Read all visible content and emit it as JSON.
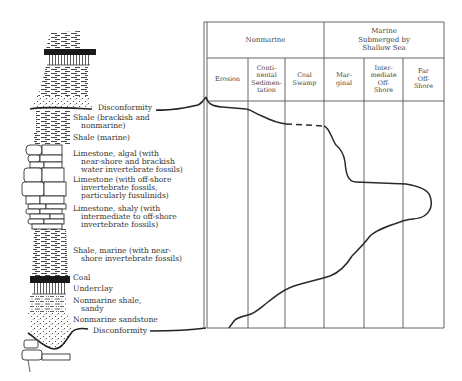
{
  "diagram": {
    "type": "stratigraphic-column-with-environment-curve",
    "column": {
      "labels": [
        {
          "id": "disconformity-top",
          "lines": [
            "Disconformity"
          ]
        },
        {
          "id": "shale-brackish",
          "lines": [
            "Shale (brackish and",
            "nonmarine)"
          ]
        },
        {
          "id": "shale-marine",
          "lines": [
            "Shale (marine)"
          ]
        },
        {
          "id": "limestone-algal",
          "lines": [
            "Limestone, algal (with",
            "near-shore and brackish",
            "water invertebrate fossils)"
          ]
        },
        {
          "id": "limestone-offshore",
          "lines": [
            "Limestone (with off-shore",
            "invertebrate fossils,",
            "particularly fusulinids)"
          ]
        },
        {
          "id": "limestone-shaly",
          "lines": [
            "Limestone, shaly (with",
            "intermediate to off-shore",
            "invertebrate fossils)"
          ]
        },
        {
          "id": "shale-marine-nearshore",
          "lines": [
            "Shale, marine (with near-",
            "shore invertebrate fossils)"
          ]
        },
        {
          "id": "coal",
          "lines": [
            "Coal"
          ]
        },
        {
          "id": "underclay",
          "lines": [
            "Underclay"
          ]
        },
        {
          "id": "nonmarine-shale",
          "lines": [
            "Nonmarine shale,",
            "sandy"
          ]
        },
        {
          "id": "nonmarine-sandstone",
          "lines": [
            "Nonmarine sandstone"
          ]
        },
        {
          "id": "disconformity-bottom",
          "lines": [
            "Disconformity"
          ]
        }
      ]
    },
    "table": {
      "groups": [
        {
          "label": "Nonmarine",
          "span": 3
        },
        {
          "label_lines": [
            "Marine",
            "Submerged by",
            "Shallow Sea"
          ],
          "span": 3
        }
      ],
      "columns": [
        {
          "id": "erosion",
          "lines": [
            "Erosion"
          ]
        },
        {
          "id": "continental-sedimentation",
          "lines": [
            "Conti-",
            "nental",
            "Sedimen-",
            "tation"
          ]
        },
        {
          "id": "coal-swamp",
          "lines": [
            "Coal",
            "Swamp"
          ]
        },
        {
          "id": "marginal",
          "lines": [
            "Mar-",
            "ginal"
          ]
        },
        {
          "id": "intermediate-offshore",
          "lines": [
            "Inter-",
            "mediate",
            "Off-",
            "Shore"
          ]
        },
        {
          "id": "far-offshore",
          "lines": [
            "Far",
            "Off-",
            "Shore"
          ]
        }
      ]
    },
    "curve": {
      "description": "Environment of deposition through the cyclothem, from bottom disconformity to top disconformity",
      "dashed_segment": "coal swamp interval",
      "line_color": "#2a2a2a"
    },
    "colors": {
      "ink": "#2a2a2a",
      "grid": "#555555",
      "text": "#333333",
      "background": "#ffffff"
    }
  }
}
